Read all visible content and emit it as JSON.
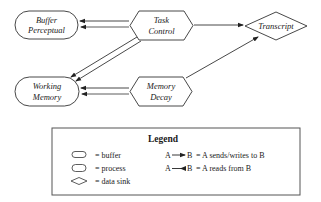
{
  "diagram": {
    "nodes": {
      "buffer_perceptual": {
        "type": "buffer",
        "line1": "Buffer",
        "line2": "Perceptual"
      },
      "working_memory": {
        "type": "buffer",
        "line1": "Working",
        "line2": "Memory"
      },
      "task_control": {
        "type": "process",
        "line1": "Task",
        "line2": "Control"
      },
      "memory_decay": {
        "type": "process",
        "line1": "Memory",
        "line2": "Decay"
      },
      "transcript": {
        "type": "data_sink",
        "label": "Transcript"
      }
    },
    "edges": [
      {
        "from": "task_control",
        "to": "buffer_perceptual",
        "kind": "sends_writes"
      },
      {
        "from": "task_control",
        "to": "buffer_perceptual",
        "kind": "reads"
      },
      {
        "from": "task_control",
        "to": "working_memory",
        "kind": "sends_writes"
      },
      {
        "from": "task_control",
        "to": "working_memory",
        "kind": "reads"
      },
      {
        "from": "memory_decay",
        "to": "working_memory",
        "kind": "sends_writes"
      },
      {
        "from": "memory_decay",
        "to": "working_memory",
        "kind": "reads"
      },
      {
        "from": "task_control",
        "to": "transcript",
        "kind": "sends_writes"
      },
      {
        "from": "memory_decay",
        "to": "transcript",
        "kind": "sends_writes"
      }
    ]
  },
  "legend": {
    "title": "Legend",
    "shapes": [
      {
        "icon": "rounded-rect-icon",
        "label": "= buffer"
      },
      {
        "icon": "hexagon-icon",
        "label": "= process"
      },
      {
        "icon": "diamond-icon",
        "label": "= data sink"
      }
    ],
    "arrows": [
      {
        "a": "A",
        "b": "B",
        "label": "= A sends/writes to B"
      },
      {
        "a": "A",
        "b": "B",
        "label": "= A reads from B"
      }
    ]
  }
}
